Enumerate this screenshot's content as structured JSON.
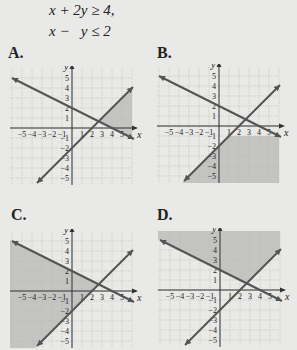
{
  "system": {
    "line1": "x + 2y ≥ 4,",
    "line2": "x −   y ≤ 2"
  },
  "options": [
    {
      "label": "A.",
      "shading": "right-wedge (x+2y≤4 region above x−y=2 … right side, x ≥ intersection)"
    },
    {
      "label": "B.",
      "shading": "below x−y=2 and below y=-1 lower right region"
    },
    {
      "label": "C.",
      "shading": "left region below x+2y=4 and above x−y=2"
    },
    {
      "label": "D.",
      "shading": "upper region above x+2y=4 and above x−y=2"
    }
  ],
  "axes": {
    "x_label": "x",
    "y_label": "y",
    "x_ticks": [
      "−5",
      "−4",
      "−3",
      "−2",
      "−1",
      "1",
      "2",
      "3",
      "4",
      "5"
    ],
    "y_ticks": [
      "5",
      "4",
      "3",
      "2",
      "1",
      "−1",
      "−2",
      "−3",
      "−4",
      "−5"
    ]
  },
  "colors": {
    "background": "#e9e9e7",
    "shade": "#c4c4c2",
    "line": "#545454",
    "grid": "#b9b9b9"
  },
  "chart_data": [
    {
      "type": "line",
      "title": "A.",
      "xlabel": "x",
      "ylabel": "y",
      "xlim": [
        -6,
        6
      ],
      "ylim": [
        -5.5,
        6
      ],
      "series": [
        {
          "name": "x + 2y = 4",
          "x": [
            -6,
            6
          ],
          "y": [
            5,
            -1
          ]
        },
        {
          "name": "x − y = 2",
          "x": [
            -3.5,
            6
          ],
          "y": [
            -5.5,
            4
          ]
        }
      ],
      "shaded_region": "x + 2y ≥ 4 and x − y ≥ 2 (right wedge)",
      "grid": true
    },
    {
      "type": "line",
      "title": "B.",
      "xlabel": "x",
      "ylabel": "y",
      "xlim": [
        -6,
        6
      ],
      "ylim": [
        -5.5,
        6
      ],
      "series": [
        {
          "name": "x + 2y = 4",
          "x": [
            -6,
            6
          ],
          "y": [
            5,
            -1
          ]
        },
        {
          "name": "x − y = 2",
          "x": [
            -3.5,
            6
          ],
          "y": [
            -5.5,
            4
          ]
        }
      ],
      "shaded_region": "x + 2y ≤ 4 and x − y ≥ 2 (bottom right)",
      "grid": true
    },
    {
      "type": "line",
      "title": "C.",
      "xlabel": "x",
      "ylabel": "y",
      "xlim": [
        -6,
        6
      ],
      "ylim": [
        -5.5,
        6
      ],
      "series": [
        {
          "name": "x + 2y = 4",
          "x": [
            -6,
            6
          ],
          "y": [
            5,
            -1
          ]
        },
        {
          "name": "x − y = 2",
          "x": [
            -3.5,
            6
          ],
          "y": [
            -5.5,
            4
          ]
        }
      ],
      "shaded_region": "x + 2y ≤ 4 and x − y ≤ 2 (left)",
      "grid": true
    },
    {
      "type": "line",
      "title": "D.",
      "xlabel": "x",
      "ylabel": "y",
      "xlim": [
        -6,
        6
      ],
      "ylim": [
        -5.5,
        6
      ],
      "series": [
        {
          "name": "x + 2y = 4",
          "x": [
            -6,
            6
          ],
          "y": [
            5,
            -1
          ]
        },
        {
          "name": "x − y = 2",
          "x": [
            -3.5,
            6
          ],
          "y": [
            -5.5,
            4
          ]
        }
      ],
      "shaded_region": "x + 2y ≥ 4 and x − y ≤ 2 (top)",
      "grid": true
    }
  ]
}
